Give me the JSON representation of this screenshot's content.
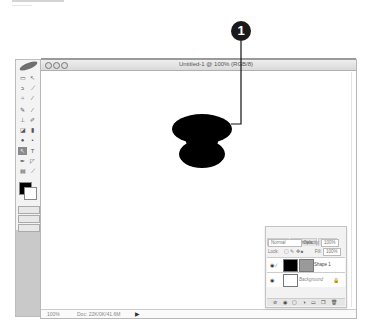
{
  "callout": {
    "number": "1",
    "color": "#1a1a1a"
  },
  "document": {
    "title": "Untitled-1 @ 100% (RGB/8)",
    "zoom": "100%",
    "doc_info": "Doc: 22K/0K/41.6M",
    "status_arrow": "▶"
  },
  "toolbox": {
    "tools": [
      "marquee",
      "move",
      "lasso",
      "magic-wand",
      "crop",
      "slice",
      "healing-brush",
      "brush",
      "clone-stamp",
      "history-brush",
      "eraser",
      "gradient",
      "blur",
      "dodge",
      "path-selection",
      "type",
      "pen",
      "shape",
      "notes",
      "eyedropper",
      "hand",
      "zoom"
    ],
    "active_tool": "path-selection",
    "foreground_color": "#000000",
    "background_color": "#ffffff"
  },
  "layers_panel": {
    "tabs": [
      {
        "label": "Layers",
        "active": true
      },
      {
        "label": "Channels",
        "active": false
      },
      {
        "label": "Paths",
        "active": false
      }
    ],
    "blend_mode": "Normal",
    "opacity_label": "Opacity:",
    "opacity": "100%",
    "lock_label": "Lock:",
    "fill_label": "Fill:",
    "fill": "100%",
    "layers": [
      {
        "name": "Shape 1",
        "visible": true,
        "selected": true
      },
      {
        "name": "Background",
        "visible": true,
        "locked": true
      }
    ],
    "footer_icons": "⊘ ◉ ▢ ◑ ▭ ❐ 🗑"
  }
}
